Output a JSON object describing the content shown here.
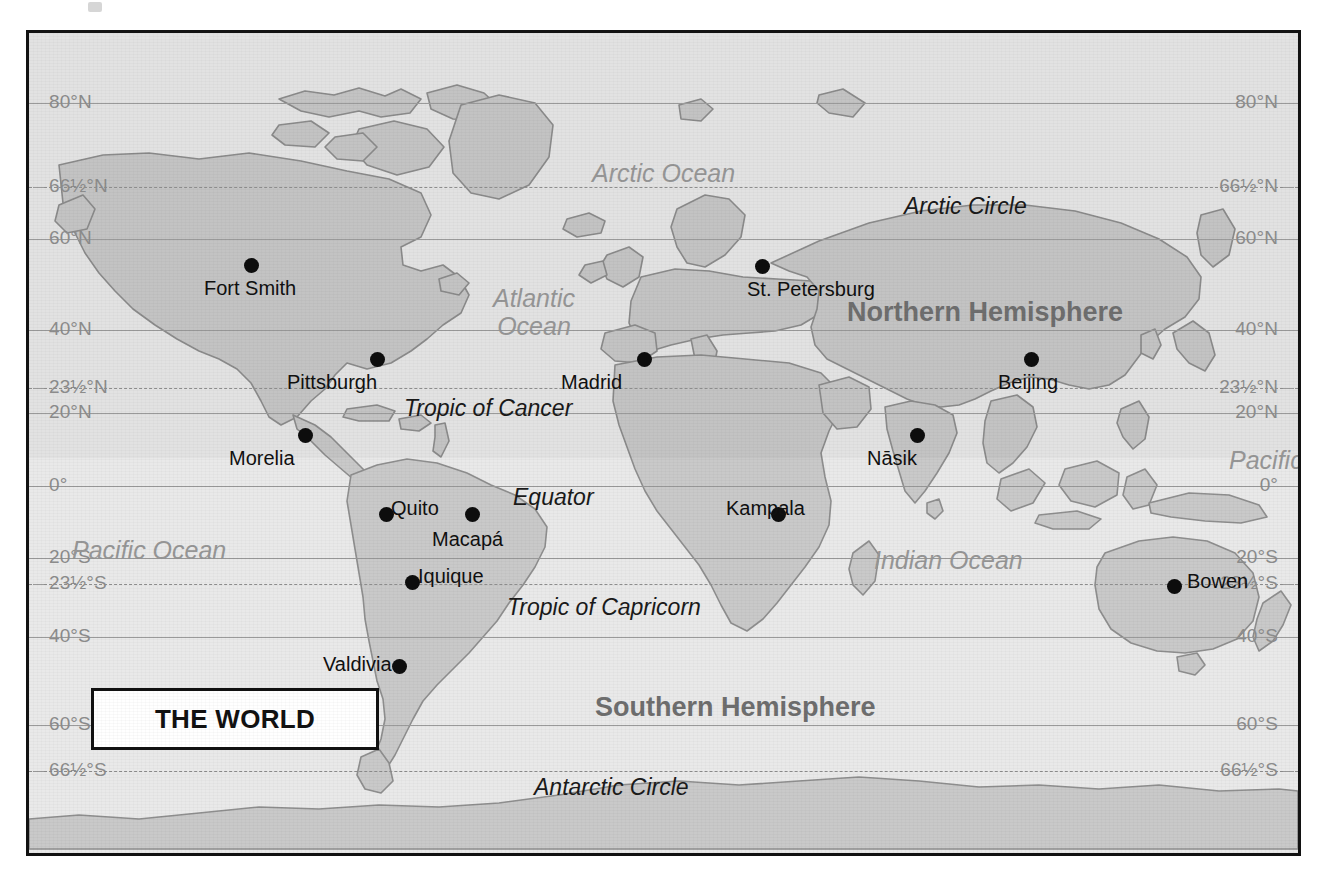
{
  "map": {
    "title": "THE WORLD",
    "projection_note": "world map with latitude graticule",
    "colors": {
      "land": "#c9c9c9",
      "ocean": "#e9e9e9",
      "graticule": "#9a9a9a",
      "ocean_label": "#969696",
      "hemisphere_label": "#6e6e6e",
      "city_dot": "#0d0d0d",
      "frame": "#121212"
    }
  },
  "latitudes": [
    {
      "label_left": "80°N",
      "label_right": "80°N",
      "y": 70,
      "style": "solid",
      "value": 80
    },
    {
      "label_left": "66½°N",
      "label_right": "66½°N",
      "y": 154,
      "style": "dashed",
      "value": 66.5
    },
    {
      "label_left": "60°N",
      "label_right": "60°N",
      "y": 206,
      "style": "solid",
      "value": 60
    },
    {
      "label_left": "40°N",
      "label_right": "40°N",
      "y": 297,
      "style": "solid",
      "value": 40
    },
    {
      "label_left": "23½°N",
      "label_right": "23½°N",
      "y": 355,
      "style": "dashed",
      "value": 23.5
    },
    {
      "label_left": "20°N",
      "label_right": "20°N",
      "y": 380,
      "style": "solid",
      "value": 20
    },
    {
      "label_left": "0°",
      "label_right": "0°",
      "y": 453,
      "style": "solid",
      "value": 0
    },
    {
      "label_left": "20°S",
      "label_right": "20°S",
      "y": 525,
      "style": "solid",
      "value": -20
    },
    {
      "label_left": "23½°S",
      "label_right": "23½°S",
      "y": 551,
      "style": "dashed",
      "value": -23.5
    },
    {
      "label_left": "40°S",
      "label_right": "40°S",
      "y": 604,
      "style": "solid",
      "value": -40
    },
    {
      "label_left": "60°S",
      "label_right": "60°S",
      "y": 692,
      "style": "solid",
      "value": -60
    },
    {
      "label_left": "66½°S",
      "label_right": "66½°S",
      "y": 738,
      "style": "dashed",
      "value": -66.5
    }
  ],
  "line_labels": [
    {
      "text": "Arctic Circle",
      "x": 875,
      "y": 160
    },
    {
      "text": "Tropic of Cancer",
      "x": 375,
      "y": 362
    },
    {
      "text": "Equator",
      "x": 484,
      "y": 451
    },
    {
      "text": "Tropic of Capricorn",
      "x": 478,
      "y": 561
    },
    {
      "text": "Antarctic Circle",
      "x": 505,
      "y": 741
    }
  ],
  "ocean_labels": [
    {
      "text": "Arctic Ocean",
      "x": 563,
      "y": 126,
      "width": 200
    },
    {
      "text": "Atlantic\nOcean",
      "x": 464,
      "y": 251,
      "width": 130
    },
    {
      "text": "Pacific Ocean",
      "x": 1200,
      "y": 413,
      "width": 190
    },
    {
      "text": "Pacific Ocean",
      "x": 43,
      "y": 503,
      "width": 190
    },
    {
      "text": "Indian Ocean",
      "x": 845,
      "y": 513,
      "width": 175
    }
  ],
  "hemisphere_labels": [
    {
      "text": "Northern Hemisphere",
      "x": 818,
      "y": 264
    },
    {
      "text": "Southern Hemisphere",
      "x": 566,
      "y": 659
    }
  ],
  "cities": [
    {
      "name": "Fort Smith",
      "dot_x": 222,
      "dot_y": 232,
      "label_x": 183,
      "label_y": 244,
      "label_align": "center"
    },
    {
      "name": "St. Petersburg",
      "dot_x": 733,
      "dot_y": 233,
      "label_x": 718,
      "label_y": 245,
      "label_align": "left"
    },
    {
      "name": "Pittsburgh",
      "dot_x": 348,
      "dot_y": 326,
      "label_x": 258,
      "label_y": 338,
      "label_align": "left"
    },
    {
      "name": "Madrid",
      "dot_x": 615,
      "dot_y": 326,
      "label_x": 532,
      "label_y": 338,
      "label_align": "left"
    },
    {
      "name": "Beijing",
      "dot_x": 1002,
      "dot_y": 326,
      "label_x": 969,
      "label_y": 338,
      "label_align": "left"
    },
    {
      "name": "Morelia",
      "dot_x": 276,
      "dot_y": 402,
      "label_x": 200,
      "label_y": 414,
      "label_align": "left"
    },
    {
      "name": "Nāsik",
      "dot_x": 888,
      "dot_y": 402,
      "label_x": 838,
      "label_y": 414,
      "label_align": "left"
    },
    {
      "name": "Quito",
      "dot_x": 357,
      "dot_y": 481,
      "label_x": 362,
      "label_y": 464,
      "label_align": "left"
    },
    {
      "name": "Macapá",
      "dot_x": 443,
      "dot_y": 481,
      "label_x": 403,
      "label_y": 495,
      "label_align": "left"
    },
    {
      "name": "Kampala",
      "dot_x": 749,
      "dot_y": 481,
      "label_x": 697,
      "label_y": 464,
      "label_align": "left"
    },
    {
      "name": "Bowen",
      "dot_x": 1145,
      "dot_y": 553,
      "label_x": 1158,
      "label_y": 537,
      "label_align": "left"
    },
    {
      "name": "Iquique",
      "dot_x": 383,
      "dot_y": 549,
      "label_x": 389,
      "label_y": 532,
      "label_align": "left"
    },
    {
      "name": "Valdivia",
      "dot_x": 370,
      "dot_y": 633,
      "label_x": 294,
      "label_y": 620,
      "label_align": "left"
    }
  ]
}
